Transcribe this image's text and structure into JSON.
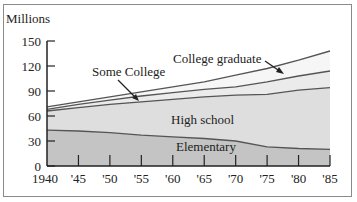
{
  "chart_data": {
    "type": "area",
    "stacked": true,
    "title": "",
    "ylabel": "Millions",
    "xlabel": "",
    "ylim": [
      0,
      150
    ],
    "yticks": [
      0,
      30,
      60,
      90,
      120,
      150
    ],
    "x": [
      1940,
      1945,
      1950,
      1955,
      1960,
      1965,
      1970,
      1975,
      1980,
      1985
    ],
    "xtick_labels": [
      "1940",
      "'45",
      "'50",
      "'55",
      "'60",
      "'65",
      "'70",
      "'75",
      "'80",
      "'85"
    ],
    "grid": false,
    "legend": "inline annotations",
    "series": [
      {
        "name": "Elementary",
        "cumulative_top": [
          43,
          42,
          40,
          37,
          35,
          33,
          30,
          23,
          21,
          20
        ]
      },
      {
        "name": "High school",
        "cumulative_top": [
          66,
          70,
          74,
          77,
          80,
          83,
          85,
          86,
          91,
          94
        ]
      },
      {
        "name": "Some College",
        "cumulative_top": [
          68,
          74,
          79,
          84,
          88,
          92,
          95,
          101,
          108,
          114
        ]
      },
      {
        "name": "College graduate",
        "cumulative_top": [
          71,
          77,
          83,
          89,
          95,
          101,
          109,
          117,
          127,
          138
        ]
      }
    ],
    "annotations": [
      "Some College",
      "College graduate",
      "High school",
      "Elementary"
    ]
  },
  "labels": {
    "ylabel": "Millions",
    "some_college": "Some College",
    "college_graduate": "College graduate",
    "high_school": "High school",
    "elementary": "Elementary"
  },
  "colors": {
    "elementary": "#c4c4c4",
    "high_school": "#dedede",
    "some_college": "#ebebeb",
    "college_graduate": "#f6f6f6",
    "line": "#555555",
    "axis": "#222222"
  }
}
